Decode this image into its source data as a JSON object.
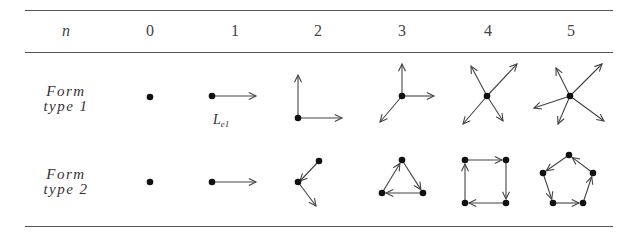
{
  "table": {
    "header": {
      "label": "n",
      "columns": [
        "0",
        "1",
        "2",
        "3",
        "4",
        "5"
      ]
    },
    "rows": [
      {
        "label_line1": "Form",
        "label_line2": "type 1",
        "description": "star graphs: one vertex with n outgoing arrows"
      },
      {
        "label_line1": "Form",
        "label_line2": "type 2",
        "description": "cycle graphs: n vertices joined in a directed cycle"
      }
    ],
    "annotation": {
      "main": "L",
      "subscript": "e1"
    }
  },
  "colors": {
    "rule": "#555555",
    "edge": "#444444",
    "node": "#111111"
  }
}
